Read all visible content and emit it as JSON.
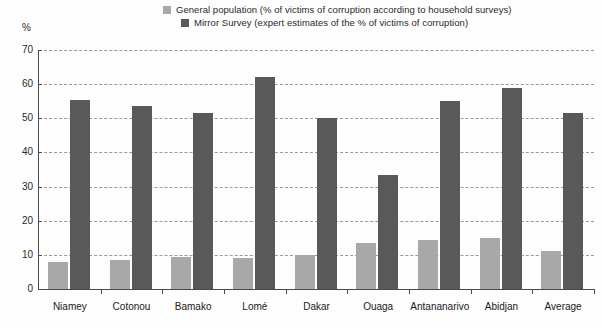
{
  "chart_data": {
    "type": "bar",
    "title": "",
    "subtitle": "",
    "xlabel": "",
    "ylabel": "%",
    "ylim": [
      0,
      70
    ],
    "ytick_step": 10,
    "yticks": [
      "0",
      "10",
      "20",
      "30",
      "40",
      "50",
      "60",
      "70"
    ],
    "grid": "horizontal-dashed",
    "legend_position": "top-center",
    "categories": [
      "Niamey",
      "Cotonou",
      "Bamako",
      "Lomé",
      "Dakar",
      "Ouaga",
      "Antananarivo",
      "Abidjan",
      "Average"
    ],
    "series": [
      {
        "name": "General population (% of victims of corruption according to household surveys)",
        "short_name": "General population",
        "color": "#a8a8a8",
        "values": [
          8,
          8.5,
          9.5,
          9,
          10,
          13.5,
          14.5,
          15,
          11
        ]
      },
      {
        "name": "Mirror Survey (expert estimates of the % of victims of corruption)",
        "short_name": "Mirror Survey",
        "color": "#595959",
        "values": [
          55.5,
          53.5,
          51.5,
          62,
          50,
          33.5,
          55,
          59,
          51.5
        ]
      }
    ]
  },
  "legend": {
    "items": [
      {
        "label": "General population (% of victims of corruption according to household surveys)",
        "color": "#a8a8a8"
      },
      {
        "label": "Mirror Survey (expert estimates of the % of victims of corruption)",
        "color": "#595959"
      }
    ]
  },
  "axes": {
    "y_unit_label": "%"
  }
}
